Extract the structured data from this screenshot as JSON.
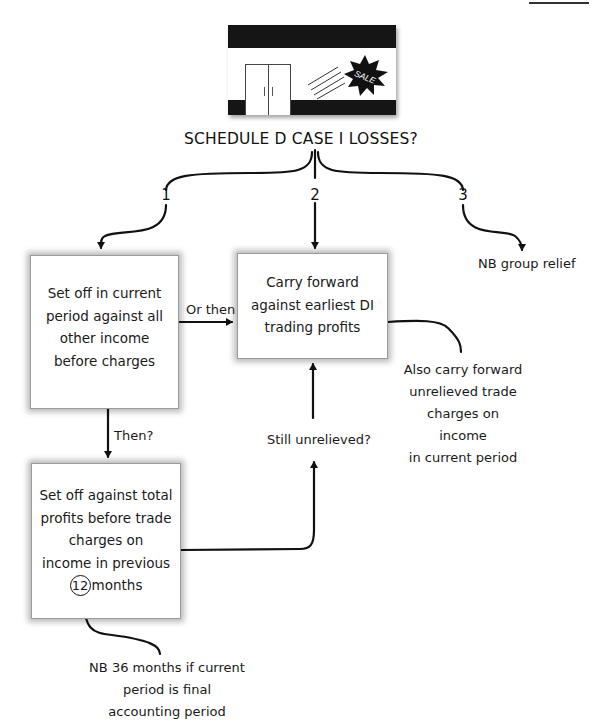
{
  "illustration": {
    "name": "shop-front",
    "sign_text": "SALE"
  },
  "title": "SCHEDULE D CASE I LOSSES?",
  "branches": [
    {
      "number": "1"
    },
    {
      "number": "2"
    },
    {
      "number": "3"
    }
  ],
  "boxes": {
    "set_off_current": {
      "text": "Set off in current\nperiod against all\nother income\nbefore charges"
    },
    "carry_forward": {
      "text": "Carry forward\nagainst earliest DI\ntrading profits"
    },
    "set_off_previous": {
      "text_lines": [
        "Set off against total",
        "profits before trade",
        "charges on",
        "income in previous"
      ],
      "circled_number": "12",
      "last_line_suffix": "months"
    }
  },
  "connector_labels": {
    "or_then": "Or then",
    "then": "Then?",
    "still_unrelieved": "Still unrelieved?"
  },
  "notes": {
    "group_relief": "NB group relief",
    "also_carry_forward": "Also carry forward\nunrelieved trade\ncharges on income\nin current period",
    "nb_36_months": "NB 36 months if current\nperiod is final\naccounting period"
  },
  "colors": {
    "ink": "#111111",
    "box_border": "#9a9a9a",
    "background": "#ffffff"
  }
}
